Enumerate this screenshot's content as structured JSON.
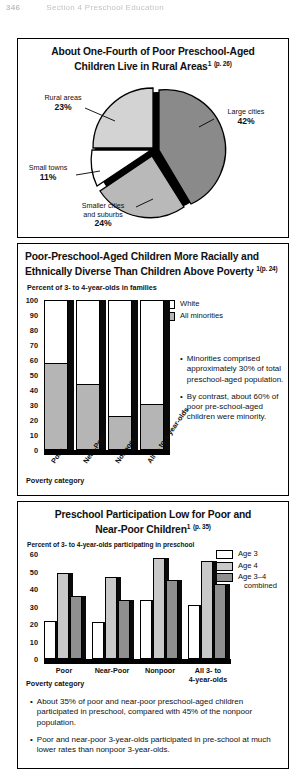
{
  "page_header": {
    "page_number": "346",
    "running_head": "Section 4 Preschool Education"
  },
  "chart_data": [
    {
      "type": "pie",
      "title_line1": "About One-Fourth of Poor Preschool-Aged",
      "title_line2": "Children Live in Rural Areas",
      "title_superscript": "1",
      "title_page_ref": "(p. 26)",
      "categories": [
        "Large cities",
        "Smaller cities and suburbs",
        "Small towns",
        "Rural areas"
      ],
      "values": [
        42,
        24,
        11,
        23
      ],
      "value_labels": [
        "42%",
        "24%",
        "11%",
        "23%"
      ],
      "colors": [
        "#8a8a8a",
        "#b9b9b9",
        "#ffffff",
        "#d3d3d3"
      ],
      "labels": {
        "large_cities_name": "Large cities",
        "large_cities_value": "42%",
        "smaller_cities_name_l1": "Smaller cities",
        "smaller_cities_name_l2": "and suburbs",
        "smaller_cities_value": "24%",
        "small_towns_name": "Small towns",
        "small_towns_value": "11%",
        "rural_areas_name": "Rural areas",
        "rural_areas_value": "23%"
      }
    },
    {
      "type": "bar",
      "title_line1": "Poor-Preschool-Aged Children More Racially and",
      "title_line2": "Ethnically Diverse Than Children Above Poverty",
      "title_superscript": "1",
      "title_page_ref": "(p. 24)",
      "ylabel": "Percent of 3- to 4-year-olds in families",
      "xlabel": "Poverty category",
      "ylim": [
        0,
        100
      ],
      "yticks": [
        "100",
        "90",
        "80",
        "70",
        "60",
        "50",
        "40",
        "30",
        "20",
        "10",
        "0"
      ],
      "categories": [
        "Poor",
        "Near-Poor",
        "Nonpoor",
        "All 3- to 4-year-olds"
      ],
      "stacked": true,
      "series": [
        {
          "name": "All minorities",
          "color": "#b5b5b5",
          "values": [
            58,
            44,
            23,
            31
          ]
        },
        {
          "name": "White",
          "color": "#ffffff",
          "values": [
            42,
            56,
            77,
            69
          ]
        }
      ],
      "legend": [
        {
          "label": "White",
          "color": "#ffffff"
        },
        {
          "label": "All minorities",
          "color": "#b5b5b5"
        }
      ],
      "bullets": [
        "Minorities comprised approximately 30% of total preschool-aged population.",
        "By contrast, about 60% of poor pre-school-aged children were minority."
      ]
    },
    {
      "type": "bar",
      "title_line1": "Preschool Participation Low for Poor and",
      "title_line2": "Near-Poor Children",
      "title_superscript": "1",
      "title_page_ref": "(p. 35)",
      "ylabel": "Percent of 3- to 4-year-olds participating in preschool",
      "xlabel": "Poverty category",
      "ylim": [
        0,
        60
      ],
      "yticks": [
        "60",
        "50",
        "40",
        "30",
        "20",
        "10",
        "0"
      ],
      "categories": [
        "Poor",
        "Near-Poor",
        "Nonpoor",
        "All 3- to 4-year-olds"
      ],
      "category_labels": [
        {
          "l1": "Poor",
          "l2": ""
        },
        {
          "l1": "Near-Poor",
          "l2": ""
        },
        {
          "l1": "Nonpoor",
          "l2": ""
        },
        {
          "l1": "All 3- to",
          "l2": "4-year-olds"
        }
      ],
      "series": [
        {
          "name": "Age 3",
          "color": "#ffffff",
          "values": [
            22,
            21,
            34,
            31
          ]
        },
        {
          "name": "Age 4",
          "color": "#c9c9c9",
          "values": [
            49,
            47,
            58,
            56
          ]
        },
        {
          "name": "Age 3-4 combined",
          "color": "#8f8f8f",
          "values": [
            36,
            34,
            45,
            43
          ]
        }
      ],
      "legend": [
        {
          "label": "Age 3",
          "label2": "",
          "color": "#ffffff"
        },
        {
          "label": "Age 4",
          "label2": "",
          "color": "#c9c9c9"
        },
        {
          "label": "Age 3–4",
          "label2": "combined",
          "color": "#8f8f8f"
        }
      ],
      "bullets": [
        "About 35% of poor and near-poor preschool-aged children participated in preschool, compared with 45% of the nonpoor population.",
        "Poor and near-poor 3-year-olds participated in pre-school at much lower rates than nonpoor 3-year-olds."
      ]
    }
  ]
}
